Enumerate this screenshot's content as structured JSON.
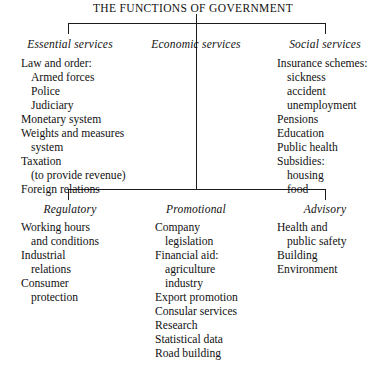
{
  "title": "THE FUNCTIONS OF GOVERNMENT",
  "colors": {
    "background": "#ffffff",
    "text": "#111111",
    "rule": "#1b1b1b"
  },
  "branches": {
    "essential_services": {
      "heading": "Essential services",
      "items": [
        {
          "text": "Law and order:",
          "indent": 0
        },
        {
          "text": "Armed forces",
          "indent": 1
        },
        {
          "text": "Police",
          "indent": 1
        },
        {
          "text": "Judiciary",
          "indent": 1
        },
        {
          "text": "Monetary system",
          "indent": 0
        },
        {
          "text": "Weights and measures",
          "indent": 0
        },
        {
          "text": "system",
          "indent": 1
        },
        {
          "text": "Taxation",
          "indent": 0
        },
        {
          "text": "(to provide revenue)",
          "indent": 1
        },
        {
          "text": "Foreign relations",
          "indent": 0
        }
      ]
    },
    "economic_services": {
      "heading": "Economic services",
      "items": []
    },
    "social_services": {
      "heading": "Social services",
      "items": [
        {
          "text": "Insurance schemes:",
          "indent": 0
        },
        {
          "text": "sickness",
          "indent": 1
        },
        {
          "text": "accident",
          "indent": 1
        },
        {
          "text": "unemployment",
          "indent": 1
        },
        {
          "text": "Pensions",
          "indent": 0
        },
        {
          "text": "Education",
          "indent": 0
        },
        {
          "text": "Public health",
          "indent": 0
        },
        {
          "text": "Subsidies:",
          "indent": 0
        },
        {
          "text": "housing",
          "indent": 1
        },
        {
          "text": "food",
          "indent": 1
        }
      ]
    },
    "regulatory": {
      "heading": "Regulatory",
      "items": [
        {
          "text": "Working hours",
          "indent": 0
        },
        {
          "text": "and conditions",
          "indent": 1
        },
        {
          "text": "Industrial",
          "indent": 0
        },
        {
          "text": "relations",
          "indent": 1
        },
        {
          "text": "Consumer",
          "indent": 0
        },
        {
          "text": "protection",
          "indent": 1
        }
      ]
    },
    "promotional": {
      "heading": "Promotional",
      "items": [
        {
          "text": "Company",
          "indent": 0
        },
        {
          "text": "legislation",
          "indent": 1
        },
        {
          "text": "Financial aid:",
          "indent": 0
        },
        {
          "text": "agriculture",
          "indent": 1
        },
        {
          "text": "industry",
          "indent": 1
        },
        {
          "text": "Export promotion",
          "indent": 0
        },
        {
          "text": "Consular services",
          "indent": 0
        },
        {
          "text": "Research",
          "indent": 0
        },
        {
          "text": "Statistical data",
          "indent": 0
        },
        {
          "text": "Road building",
          "indent": 0
        }
      ]
    },
    "advisory": {
      "heading": "Advisory",
      "items": [
        {
          "text": "Health and",
          "indent": 0
        },
        {
          "text": "public safety",
          "indent": 1
        },
        {
          "text": "Building",
          "indent": 0
        },
        {
          "text": "Environment",
          "indent": 0
        }
      ]
    }
  }
}
